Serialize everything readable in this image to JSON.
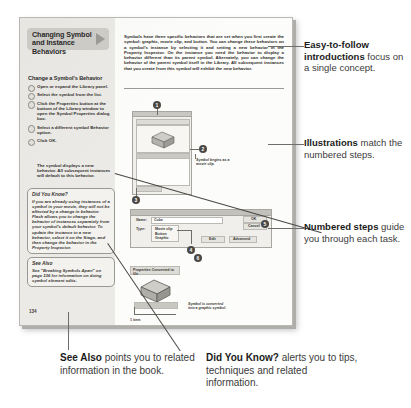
{
  "document": {
    "page_number": "134",
    "section_title": "Changing Symbol and Instance Behaviors",
    "intro_paragraph": "Symbols have three specific behaviors that are set when you first create the symbol: graphic, movie clip, and button. You can change these behaviors on a symbol's instance by selecting it and setting a new behavior in the Property Inspector. On the instance you need the behavior to display a behavior different than its parent symbol. Alternately, you can change the behavior of the parent symbol itself in the Library. All subsequent instances that you create from this symbol will exhibit the new behavior.",
    "task_heading": "Change a Symbol's Behavior",
    "steps": [
      "Open or expand the Library panel.",
      "Select the symbol from the list.",
      "Click the Properties button at the bottom of the Library window to open the Symbol Properties dialog box.",
      "Select a different symbol Behavior option.",
      "Click OK."
    ],
    "result_text": "The symbol displays a new behavior. All subsequent instances will default to this behavior.",
    "did_you_know": {
      "heading": "Did You Know?",
      "body": "If you are already using instances of a symbol in your movie, they will not be affected by a change in behavior. Flash allows you to change the behavior of instances separately from your symbol's default behavior. To update the instance to a new behavior, select it on the Stage, and then change the behavior in the Property Inspector."
    },
    "see_also": {
      "heading": "See Also",
      "body": "See \"Breaking Symbols Apart\" on page 136 for information on doing symbol element edits."
    },
    "illustration_captions": [
      "Symbol begins as a movie clip.",
      "Symbol is converted into a graphic symbol."
    ],
    "dialog": {
      "title": "Symbol Properties",
      "name_label": "Name:",
      "name_value": "Cube",
      "behavior_label": "Type:",
      "options": [
        "Movie clip",
        "Button",
        "Graphic"
      ],
      "buttons": [
        "OK",
        "Cancel",
        "Edit",
        "Advanced"
      ]
    },
    "panel": {
      "title": "Library",
      "status_bar": "1 item"
    },
    "converted_label": "Properties Converted to file",
    "callout_numbers": [
      "1",
      "2",
      "3",
      "4",
      "5",
      "6"
    ]
  },
  "annotations": [
    {
      "id": "intro",
      "bold": "Easy-to-follow introductions",
      "rest": "focus on a single concept."
    },
    {
      "id": "illustrations",
      "bold": "Illustrations",
      "rest": "match the numbered steps."
    },
    {
      "id": "numbered-steps",
      "bold": "Numbered steps",
      "rest": "guide you through each task."
    },
    {
      "id": "see-also",
      "bold": "See Also",
      "rest": "points you to related information in the book."
    },
    {
      "id": "did-you-know",
      "bold": "Did You Know?",
      "rest": "alerts you to tips, techniques and related information."
    }
  ],
  "colors": {
    "paper": "#fcfcfa",
    "band": "#eceae6",
    "title_block": "#cfcdc8",
    "ink": "#2e2c29",
    "annotation": "#3b3b3b",
    "rule": "#6e6e6e"
  }
}
